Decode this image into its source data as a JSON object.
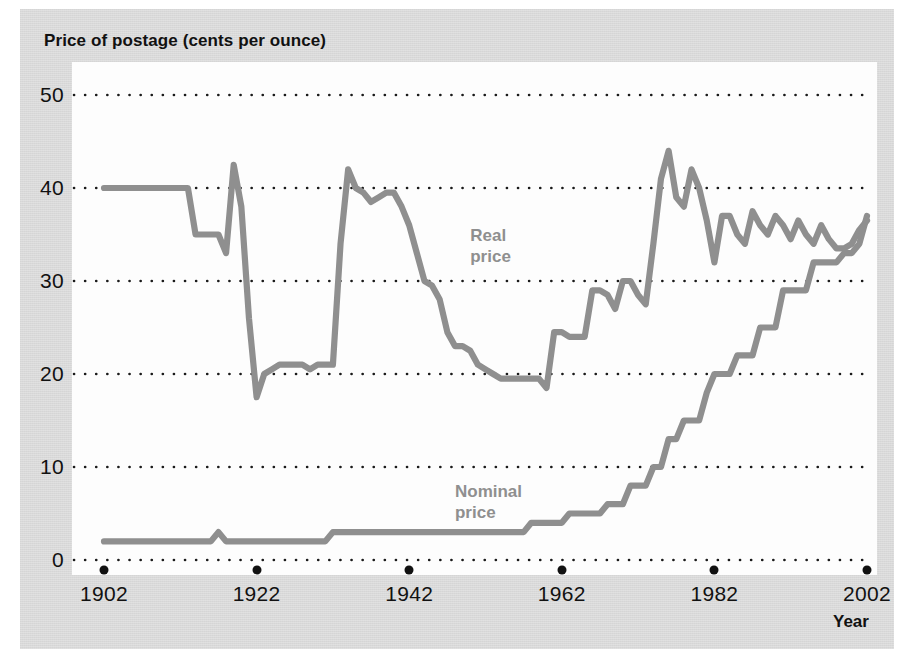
{
  "chart_data": {
    "type": "line",
    "title": "Price of postage (cents per ounce)",
    "xlabel": "Year",
    "ylabel": "Price of postage (cents per ounce)",
    "xlim": [
      1902,
      2002
    ],
    "ylim": [
      0,
      50
    ],
    "grid": true,
    "grid_style": "dotted-horizontal",
    "legend_position": "inline-annotation",
    "x_ticks": [
      1902,
      1922,
      1942,
      1962,
      1982,
      2002
    ],
    "y_ticks": [
      0,
      10,
      20,
      30,
      40,
      50
    ],
    "series": [
      {
        "name": "Real price",
        "color": "#8f8f8f",
        "label_x": 1950,
        "label_y": 36,
        "x": [
          1902,
          1903,
          1904,
          1905,
          1906,
          1907,
          1908,
          1909,
          1910,
          1911,
          1912,
          1913,
          1914,
          1915,
          1916,
          1917,
          1918,
          1919,
          1920,
          1921,
          1922,
          1923,
          1924,
          1925,
          1926,
          1927,
          1928,
          1929,
          1930,
          1931,
          1932,
          1933,
          1934,
          1935,
          1936,
          1937,
          1938,
          1939,
          1940,
          1941,
          1942,
          1943,
          1944,
          1945,
          1946,
          1947,
          1948,
          1949,
          1950,
          1951,
          1952,
          1953,
          1954,
          1955,
          1956,
          1957,
          1958,
          1959,
          1960,
          1961,
          1962,
          1963,
          1964,
          1965,
          1966,
          1967,
          1968,
          1969,
          1970,
          1971,
          1972,
          1973,
          1974,
          1975,
          1976,
          1977,
          1978,
          1979,
          1980,
          1981,
          1982,
          1983,
          1984,
          1985,
          1986,
          1987,
          1988,
          1989,
          1990,
          1991,
          1992,
          1993,
          1994,
          1995,
          1996,
          1997,
          1998,
          1999,
          2000,
          2001,
          2002
        ],
        "values": [
          40,
          40,
          40,
          40,
          40,
          40,
          40,
          40,
          40,
          40,
          40,
          40,
          35,
          35,
          35,
          35,
          33,
          42.5,
          38,
          26,
          17.5,
          20,
          20.5,
          21,
          21,
          21,
          21,
          20.5,
          21,
          21,
          21,
          34,
          42,
          40,
          39.5,
          38.5,
          39,
          39.5,
          39.5,
          38,
          36,
          33,
          30,
          29.5,
          28,
          24.5,
          23,
          23,
          22.5,
          21,
          20.5,
          20,
          19.5,
          19.5,
          19.5,
          19.5,
          19.5,
          19.5,
          18.5,
          24.5,
          24.5,
          24,
          24,
          24,
          29,
          29,
          28.5,
          27,
          30,
          30,
          28.5,
          27.5,
          34,
          41,
          44,
          39,
          38,
          42,
          40,
          36.5,
          32,
          37,
          37,
          35,
          34,
          37.5,
          36,
          35,
          37,
          36,
          34.5,
          36.5,
          35,
          34,
          36,
          34.5,
          33.5,
          33.5,
          34,
          35.5,
          36.5
        ]
      },
      {
        "name": "Nominal price",
        "color": "#8f8f8f",
        "label_x": 1948,
        "label_y": 8.5,
        "x": [
          1902,
          1903,
          1904,
          1905,
          1906,
          1907,
          1908,
          1909,
          1910,
          1911,
          1912,
          1913,
          1914,
          1915,
          1916,
          1917,
          1918,
          1919,
          1920,
          1921,
          1922,
          1923,
          1924,
          1925,
          1926,
          1927,
          1928,
          1929,
          1930,
          1931,
          1932,
          1933,
          1934,
          1935,
          1936,
          1937,
          1938,
          1939,
          1940,
          1941,
          1942,
          1943,
          1944,
          1945,
          1946,
          1947,
          1948,
          1949,
          1950,
          1951,
          1952,
          1953,
          1954,
          1955,
          1956,
          1957,
          1958,
          1959,
          1960,
          1961,
          1962,
          1963,
          1964,
          1965,
          1966,
          1967,
          1968,
          1969,
          1970,
          1971,
          1972,
          1973,
          1974,
          1975,
          1976,
          1977,
          1978,
          1979,
          1980,
          1981,
          1982,
          1983,
          1984,
          1985,
          1986,
          1987,
          1988,
          1989,
          1990,
          1991,
          1992,
          1993,
          1994,
          1995,
          1996,
          1997,
          1998,
          1999,
          2000,
          2001,
          2002
        ],
        "values": [
          2,
          2,
          2,
          2,
          2,
          2,
          2,
          2,
          2,
          2,
          2,
          2,
          2,
          2,
          2,
          3,
          2,
          2,
          2,
          2,
          2,
          2,
          2,
          2,
          2,
          2,
          2,
          2,
          2,
          2,
          3,
          3,
          3,
          3,
          3,
          3,
          3,
          3,
          3,
          3,
          3,
          3,
          3,
          3,
          3,
          3,
          3,
          3,
          3,
          3,
          3,
          3,
          3,
          3,
          3,
          3,
          4,
          4,
          4,
          4,
          4,
          5,
          5,
          5,
          5,
          5,
          6,
          6,
          6,
          8,
          8,
          8,
          10,
          10,
          13,
          13,
          15,
          15,
          15,
          18,
          20,
          20,
          20,
          22,
          22,
          22,
          25,
          25,
          25,
          29,
          29,
          29,
          29,
          32,
          32,
          32,
          32,
          33,
          33,
          34,
          37
        ]
      }
    ]
  },
  "axes": {
    "x_tick_labels": [
      "1902",
      "1922",
      "1942",
      "1962",
      "1982",
      "2002"
    ],
    "y_tick_labels": [
      "0",
      "10",
      "20",
      "30",
      "40",
      "50"
    ],
    "x_axis_title": "Year"
  },
  "annotations": [
    {
      "id": "real-price-label",
      "line1": "Real",
      "line2": "price"
    },
    {
      "id": "nominal-price-label",
      "line1": "Nominal",
      "line2": "price"
    }
  ],
  "colors": {
    "page_background": "#d9d9d9",
    "plot_background": "#fdfdfd",
    "series_line": "#8f8f8f",
    "grid_dots": "#1a1a1a",
    "text": "#111111",
    "annotation_text": "#8f8f8f"
  }
}
